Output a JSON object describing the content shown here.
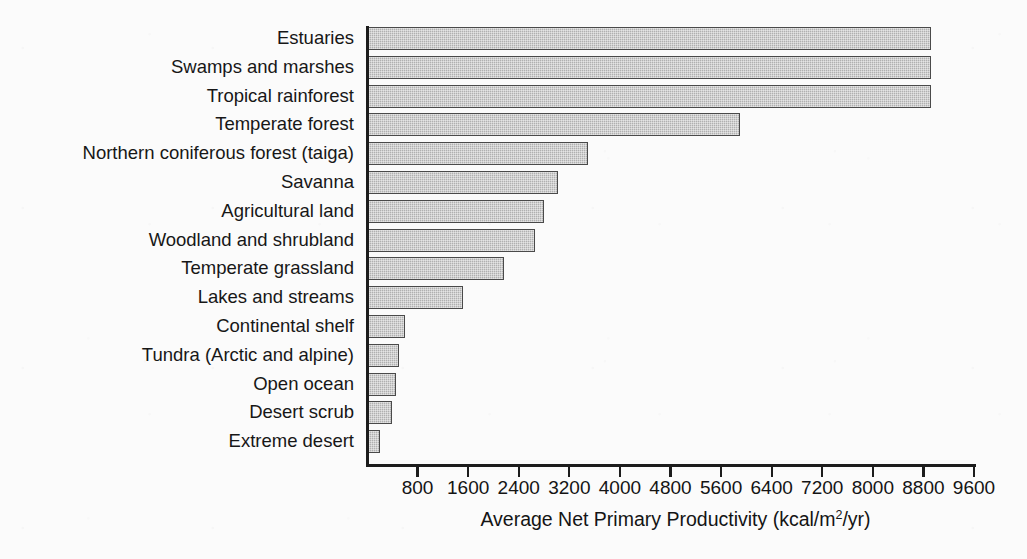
{
  "chart_data": {
    "type": "bar",
    "orientation": "horizontal",
    "title": "",
    "xlabel": "Average Net Primary Productivity (kcal/m2/yr)",
    "xlabel_parts": {
      "before": "Average Net Primary Productivity (kcal/m",
      "superscript": "2",
      "after": "/yr)"
    },
    "ylabel": "",
    "xlim": [
      0,
      9600
    ],
    "grid": false,
    "legend": null,
    "xticks": [
      800,
      1600,
      2400,
      3200,
      4000,
      4800,
      5600,
      6400,
      7200,
      8000,
      8800,
      9600
    ],
    "xtick_labels": [
      "800",
      "1600",
      "2400",
      "3200",
      "4000",
      "4800",
      "5600",
      "6400",
      "7200",
      "8000",
      "8800",
      "9600"
    ],
    "categories": [
      "Estuaries",
      "Swamps and marshes",
      "Tropical rainforest",
      "Temperate forest",
      "Northern coniferous forest (taiga)",
      "Savanna",
      "Agricultural land",
      "Woodland and shrubland",
      "Temperate grassland",
      "Lakes and streams",
      "Continental shelf",
      "Tundra (Arctic and alpine)",
      "Open ocean",
      "Desert scrub",
      "Extreme desert"
    ],
    "values": [
      8900,
      8900,
      8900,
      5880,
      3480,
      3000,
      2780,
      2640,
      2150,
      1500,
      585,
      490,
      440,
      380,
      190
    ],
    "bar_color": "#b0b0b0",
    "bar_edge_color": "#4a4a4a",
    "background_color": "#fbfbfb",
    "text_color": "#141414"
  }
}
